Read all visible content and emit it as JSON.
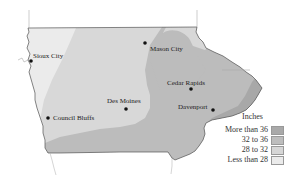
{
  "map": {
    "region": "Iowa",
    "cities": [
      {
        "name": "Sioux City",
        "dot": [
          31,
          61
        ],
        "label_pos": [
          33,
          53
        ]
      },
      {
        "name": "Mason City",
        "dot": [
          145,
          43
        ],
        "label_pos": [
          150,
          46
        ]
      },
      {
        "name": "Cedar Rapids",
        "dot": [
          191,
          89
        ],
        "label_pos": [
          167,
          80
        ]
      },
      {
        "name": "Des Moines",
        "dot": [
          126,
          109
        ],
        "label_pos": [
          107,
          98
        ]
      },
      {
        "name": "Davenport",
        "dot": [
          213,
          110
        ],
        "label_pos": [
          178,
          104
        ]
      },
      {
        "name": "Council Bluffs",
        "dot": [
          48,
          118
        ],
        "label_pos": [
          53,
          115
        ]
      }
    ]
  },
  "legend": {
    "title": "Inches",
    "items": [
      {
        "label": "More than 36",
        "color": "#a9a9a9"
      },
      {
        "label": "32 to 36",
        "color": "#bdbdbd"
      },
      {
        "label": "28 to 32",
        "color": "#d6d6d6"
      },
      {
        "label": "Less than 28",
        "color": "#ebebeb"
      }
    ]
  },
  "colors": {
    "less_than_28": "#ebebeb",
    "28_to_32": "#d8d8d8",
    "32_to_36": "#bcbcbc",
    "more_than_36": "#a8a8a8",
    "border": "#555555"
  }
}
